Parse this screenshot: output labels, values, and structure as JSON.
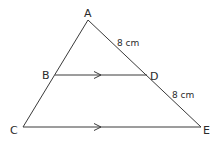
{
  "diagram": {
    "type": "geometry-triangle",
    "line_color": "#3a3a3a",
    "points": [
      {
        "name": "A",
        "x": 88,
        "y": 20
      },
      {
        "name": "B",
        "x": 55,
        "y": 75
      },
      {
        "name": "D",
        "x": 147,
        "y": 75
      },
      {
        "name": "C",
        "x": 23,
        "y": 127
      },
      {
        "name": "E",
        "x": 201,
        "y": 127
      }
    ],
    "labels": {
      "A": "A",
      "B": "B",
      "C": "C",
      "D": "D",
      "E": "E"
    },
    "measurements": {
      "AD": "8 cm",
      "DE": "8 cm"
    },
    "parallel_marks": [
      "BD",
      "CE"
    ]
  }
}
